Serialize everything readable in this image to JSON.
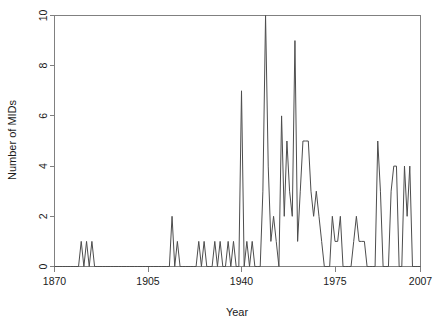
{
  "chart_data": {
    "type": "line",
    "title": "",
    "xlabel": "Year",
    "ylabel": "Number of MIDs",
    "xlim": [
      1870,
      2007
    ],
    "ylim": [
      0,
      10
    ],
    "grid": false,
    "legend": null,
    "xticks": [
      1870,
      1905,
      1940,
      1975,
      2007
    ],
    "xtick_labels": [
      "1870",
      "1905",
      "1940",
      "1975",
      "2007"
    ],
    "yticks": [
      0,
      2,
      4,
      6,
      8,
      10
    ],
    "ytick_labels": [
      "0",
      "2",
      "4",
      "6",
      "8",
      "10"
    ],
    "series_name": "Number of MIDs",
    "line_color": "#4d4d4d",
    "x": [
      1870,
      1871,
      1872,
      1873,
      1874,
      1875,
      1876,
      1877,
      1878,
      1879,
      1880,
      1881,
      1882,
      1883,
      1884,
      1885,
      1886,
      1887,
      1888,
      1889,
      1890,
      1891,
      1892,
      1893,
      1894,
      1895,
      1896,
      1897,
      1898,
      1899,
      1900,
      1901,
      1902,
      1903,
      1904,
      1905,
      1906,
      1907,
      1908,
      1909,
      1910,
      1911,
      1912,
      1913,
      1914,
      1915,
      1916,
      1917,
      1918,
      1919,
      1920,
      1921,
      1922,
      1923,
      1924,
      1925,
      1926,
      1927,
      1928,
      1929,
      1930,
      1931,
      1932,
      1933,
      1934,
      1935,
      1936,
      1937,
      1938,
      1939,
      1940,
      1941,
      1942,
      1943,
      1944,
      1945,
      1946,
      1947,
      1948,
      1949,
      1950,
      1951,
      1952,
      1953,
      1954,
      1955,
      1956,
      1957,
      1958,
      1959,
      1960,
      1961,
      1962,
      1963,
      1964,
      1965,
      1966,
      1967,
      1968,
      1969,
      1970,
      1971,
      1972,
      1973,
      1974,
      1975,
      1976,
      1977,
      1978,
      1979,
      1980,
      1981,
      1982,
      1983,
      1984,
      1985,
      1986,
      1987,
      1988,
      1989,
      1990,
      1991,
      1992,
      1993,
      1994,
      1995,
      1996,
      1997,
      1998,
      1999,
      2000,
      2001,
      2002,
      2003,
      2004,
      2005,
      2006,
      2007
    ],
    "values": [
      0,
      0,
      0,
      0,
      0,
      0,
      0,
      0,
      0,
      0,
      1,
      0,
      1,
      0,
      1,
      0,
      0,
      0,
      0,
      0,
      0,
      0,
      0,
      0,
      0,
      0,
      0,
      0,
      0,
      0,
      0,
      0,
      0,
      0,
      0,
      0,
      0,
      0,
      0,
      0,
      0,
      0,
      0,
      0,
      2,
      0,
      1,
      0,
      0,
      0,
      0,
      0,
      0,
      0,
      1,
      0,
      1,
      0,
      0,
      0,
      1,
      0,
      1,
      0,
      0,
      1,
      0,
      1,
      0,
      0,
      7,
      0,
      1,
      0,
      1,
      0,
      0,
      0,
      3,
      10,
      4,
      1,
      2,
      1,
      0,
      6,
      2,
      5,
      3,
      2,
      9,
      1,
      3,
      5,
      5,
      5,
      3,
      2,
      3,
      2,
      1,
      0,
      0,
      0,
      2,
      1,
      1,
      2,
      0,
      0,
      0,
      0,
      1,
      2,
      1,
      1,
      1,
      0,
      0,
      0,
      0,
      5,
      3,
      0,
      0,
      0,
      3,
      4,
      4,
      0,
      0,
      4,
      2,
      4,
      0,
      0,
      0,
      0
    ]
  },
  "axes": {
    "y_label": "Number of MIDs",
    "x_label": "Year"
  }
}
